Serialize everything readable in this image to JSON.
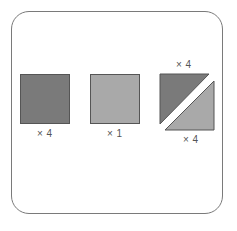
{
  "diagram": {
    "pieces": [
      {
        "shape": "square",
        "color": "#7a7a7a",
        "count_label": "× 4"
      },
      {
        "shape": "square",
        "color": "#a9a9a9",
        "count_label": "× 1"
      },
      {
        "shape": "half-square-triangle",
        "top_color": "#7a7a7a",
        "bottom_color": "#a9a9a9",
        "top_count_label": "× 4",
        "bottom_count_label": "× 4"
      }
    ]
  }
}
